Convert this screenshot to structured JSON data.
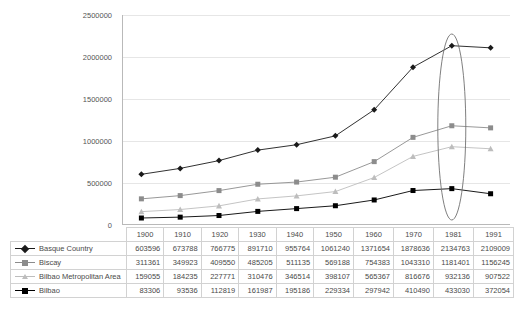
{
  "chart_data": {
    "type": "line",
    "title": "",
    "xlabel": "",
    "ylabel": "",
    "categories": [
      "1900",
      "1910",
      "1920",
      "1930",
      "1940",
      "1950",
      "1960",
      "1970",
      "1981",
      "1991"
    ],
    "yticks": [
      "0",
      "500000",
      "1000000",
      "1500000",
      "2000000",
      "2500000"
    ],
    "ytick_values": [
      0,
      500000,
      1000000,
      1500000,
      2000000,
      2500000
    ],
    "ylim": [
      0,
      2500000
    ],
    "grid": true,
    "legend_position": "table-left",
    "annotations": [
      {
        "type": "ellipse",
        "target_category": "1981",
        "note": "vertical ellipse highlighting the 1981 column"
      }
    ],
    "series": [
      {
        "name": "Basque Country",
        "color": "#1a1a1a",
        "marker": "diamond",
        "values": [
          603596,
          673788,
          766775,
          891710,
          955764,
          1061240,
          1371654,
          1878636,
          2134763,
          2109009
        ]
      },
      {
        "name": "Biscay",
        "color": "#8c8c8c",
        "marker": "square",
        "values": [
          311361,
          349923,
          409550,
          485205,
          511135,
          569188,
          754383,
          1043310,
          1181401,
          1156245
        ]
      },
      {
        "name": "Bilbao Metropolitan Area",
        "color": "#bdbdbd",
        "marker": "triangle",
        "values": [
          159055,
          184235,
          227771,
          310476,
          346514,
          398107,
          565367,
          816676,
          932136,
          907522
        ]
      },
      {
        "name": "Bilbao",
        "color": "#000000",
        "marker": "square",
        "values": [
          83306,
          93536,
          112819,
          161987,
          195186,
          229334,
          297942,
          410490,
          433030,
          372054
        ]
      }
    ]
  },
  "colors": {
    "gridline": "#e6e6e6",
    "axis": "#b9b9b9",
    "table_border": "#d2d2d2",
    "text": "#4a4a4a",
    "annotation": "#707070"
  }
}
